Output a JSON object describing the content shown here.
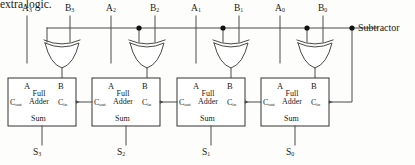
{
  "diagram": {
    "title_fragment": "extra logic.",
    "control_label": "Subtractor",
    "type": "4-bit ripple-carry adder/subtractor with XOR gates",
    "colors": {
      "wire": "#4a4a4a",
      "box_stroke": "#333333",
      "text": "#1a1a1a",
      "background": "#fdfdfb",
      "junction_dot": "#111111"
    },
    "inputs": [
      {
        "name": "A3",
        "base": "A",
        "sub": "3",
        "x": 27
      },
      {
        "name": "B3",
        "base": "B",
        "sub": "3",
        "x": 70
      },
      {
        "name": "A2",
        "base": "A",
        "sub": "2",
        "x": 111
      },
      {
        "name": "B2",
        "base": "B",
        "sub": "2",
        "x": 155
      },
      {
        "name": "A1",
        "base": "A",
        "sub": "1",
        "x": 196
      },
      {
        "name": "B1",
        "base": "B",
        "sub": "1",
        "x": 239
      },
      {
        "name": "A0",
        "base": "A",
        "sub": "0",
        "x": 280
      },
      {
        "name": "B0",
        "base": "B",
        "sub": "0",
        "x": 323
      }
    ],
    "outputs": [
      {
        "name": "S3",
        "base": "S",
        "sub": "3",
        "x": 37
      },
      {
        "name": "S2",
        "base": "S",
        "sub": "2",
        "x": 121
      },
      {
        "name": "S1",
        "base": "S",
        "sub": "1",
        "x": 206
      },
      {
        "name": "S0",
        "base": "S",
        "sub": "0",
        "x": 290
      }
    ],
    "adders": [
      {
        "index": 3,
        "x": 8,
        "label_a": "A",
        "label_b": "B",
        "label_cout": "Cout",
        "label_cin": "Cin",
        "label_sum": "Sum",
        "name_line1": "Full",
        "name_line2": "Adder"
      },
      {
        "index": 2,
        "x": 92,
        "label_a": "A",
        "label_b": "B",
        "label_cout": "Cout",
        "label_cin": "Cin",
        "label_sum": "Sum",
        "name_line1": "Full",
        "name_line2": "Adder"
      },
      {
        "index": 1,
        "x": 177,
        "label_a": "A",
        "label_b": "B",
        "label_cout": "Cout",
        "label_cin": "Cin",
        "label_sum": "Sum",
        "name_line1": "Full",
        "name_line2": "Adder"
      },
      {
        "index": 0,
        "x": 261,
        "label_a": "A",
        "label_b": "B",
        "label_cout": "Cout",
        "label_cin": "Cin",
        "label_sum": "Sum",
        "name_line1": "Full",
        "name_line2": "Adder"
      }
    ],
    "xor_gates": [
      {
        "index": 3,
        "cx": 62
      },
      {
        "index": 2,
        "cx": 147
      },
      {
        "index": 1,
        "cx": 231
      },
      {
        "index": 0,
        "cx": 315
      }
    ],
    "junction_dots": [
      {
        "x": 139,
        "y": 28
      },
      {
        "x": 223,
        "y": 28
      },
      {
        "x": 307,
        "y": 28
      },
      {
        "x": 352,
        "y": 28
      }
    ]
  }
}
